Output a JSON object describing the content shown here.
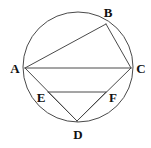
{
  "figure": {
    "background_color": "#ffffff",
    "stroke_color": "#4a4a4a",
    "label_color": "#111111",
    "stroke_width": 1,
    "canvas": {
      "width": 151,
      "height": 148
    }
  },
  "circle": {
    "name": "main-circle",
    "cx": 78,
    "cy": 67,
    "r": 55
  },
  "points": [
    {
      "id": "A",
      "label": "A",
      "x": 25,
      "y": 68,
      "label_x": 15,
      "label_y": 68
    },
    {
      "id": "B",
      "label": "B",
      "x": 106,
      "y": 24,
      "label_x": 108,
      "label_y": 12
    },
    {
      "id": "C",
      "label": "C",
      "x": 131,
      "y": 68,
      "label_x": 141,
      "label_y": 68
    },
    {
      "id": "D",
      "label": "D",
      "x": 77,
      "y": 121,
      "label_x": 78,
      "label_y": 134
    },
    {
      "id": "E",
      "label": "E",
      "x": 48,
      "y": 92,
      "label_x": 41,
      "label_y": 97
    },
    {
      "id": "F",
      "label": "F",
      "x": 106,
      "y": 92,
      "label_x": 113,
      "label_y": 97
    }
  ],
  "segments": [
    {
      "id": "AB",
      "name": "chord-a-b",
      "x1": 25,
      "y1": 68,
      "x2": 106,
      "y2": 24
    },
    {
      "id": "BC",
      "name": "chord-b-c",
      "x1": 106,
      "y1": 24,
      "x2": 131,
      "y2": 68
    },
    {
      "id": "AC",
      "name": "chord-a-c",
      "x1": 25,
      "y1": 68,
      "x2": 131,
      "y2": 68
    },
    {
      "id": "AD",
      "name": "chord-a-d",
      "x1": 25,
      "y1": 68,
      "x2": 77,
      "y2": 121
    },
    {
      "id": "DC",
      "name": "chord-d-c",
      "x1": 77,
      "y1": 121,
      "x2": 131,
      "y2": 68
    },
    {
      "id": "EF",
      "name": "segment-e-f",
      "x1": 48,
      "y1": 92,
      "x2": 106,
      "y2": 92
    },
    {
      "id": "ED",
      "name": "segment-e-d",
      "x1": 48,
      "y1": 92,
      "x2": 77,
      "y2": 121
    },
    {
      "id": "FD",
      "name": "segment-f-d",
      "x1": 106,
      "y1": 92,
      "x2": 77,
      "y2": 121
    }
  ]
}
